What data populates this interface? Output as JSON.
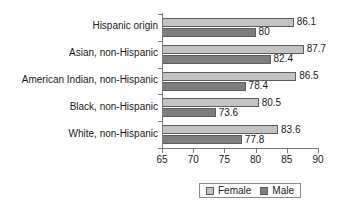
{
  "chart_data": {
    "type": "bar",
    "orientation": "horizontal",
    "title": "",
    "xlabel": "",
    "ylabel": "",
    "xlim": [
      65,
      90
    ],
    "xticks": [
      65,
      70,
      75,
      80,
      85,
      90
    ],
    "grid": false,
    "legend_position": "bottom",
    "categories": [
      "Hispanic origin",
      "Asian, non-Hispanic",
      "American Indian, non-Hispanic",
      "Black, non-Hispanic",
      "White, non-Hispanic"
    ],
    "series": [
      {
        "name": "Female",
        "color": "#c3c3c3",
        "values": [
          86.1,
          87.7,
          86.5,
          80.5,
          83.6
        ],
        "labels": [
          "86.1",
          "87.7",
          "86.5",
          "80.5",
          "83.6"
        ]
      },
      {
        "name": "Male",
        "color": "#7e7e7e",
        "values": [
          80,
          82.4,
          78.4,
          73.6,
          77.8
        ],
        "labels": [
          "80",
          "82.4",
          "78.4",
          "73.6",
          "77.8"
        ]
      }
    ]
  },
  "legend": {
    "items": [
      {
        "label": "Female",
        "swatch": "female"
      },
      {
        "label": "Male",
        "swatch": "male"
      }
    ]
  },
  "axis": {
    "tick_labels": [
      "65",
      "70",
      "75",
      "80",
      "85",
      "90"
    ]
  }
}
